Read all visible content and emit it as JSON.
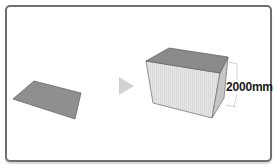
{
  "diagram": {
    "before": {
      "shape": "flat-rectangle-face",
      "fill": "#8f8f8f"
    },
    "operation": {
      "icon": "right-triangle-arrow-icon",
      "color": "#d0d0d0"
    },
    "after": {
      "shape": "extruded-box",
      "top_fill": "#8a8a8a",
      "front_fill": "#e4e4e4",
      "side_fill": "#c8c8c8",
      "dimension_label": "2000mm"
    },
    "frame_color": "#6f6f6f"
  }
}
